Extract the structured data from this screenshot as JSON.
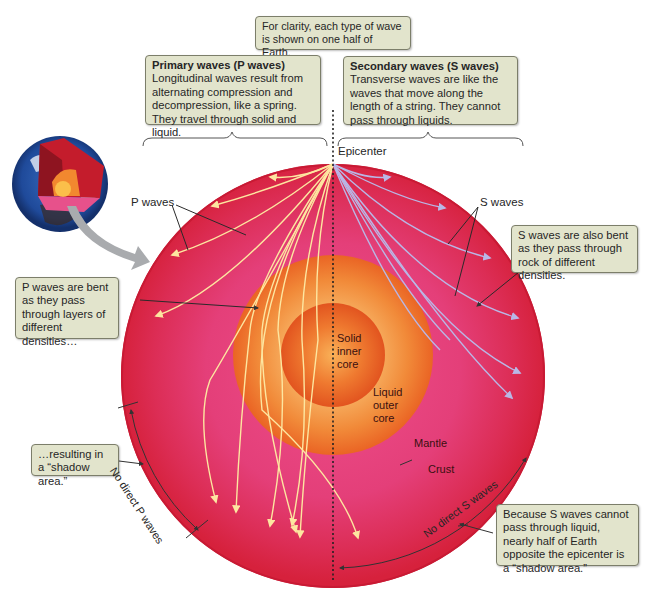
{
  "figure": {
    "title_note": "For clarity, each type of wave is shown on one half of Earth.",
    "colors": {
      "mantle": "#e0356a",
      "crust_edge": "#d9213f",
      "outer_core": "#f27a2a",
      "inner_core": "#e8521d",
      "p_wave": "#fde6a0",
      "s_wave": "#b9b7e6",
      "callout_bg": "#e2e4cc",
      "callout_border": "#7c7e6a"
    }
  },
  "callouts": {
    "primary": {
      "title": "Primary waves (P waves)",
      "body": "Longitudinal waves result from alternating compression and decompression, like a spring. They travel through solid and liquid."
    },
    "secondary": {
      "title": "Secondary waves (S waves)",
      "body": "Transverse waves are like the waves that move along the length of a string. They cannot pass through liquids."
    },
    "p_bent": "P waves are bent as they pass through layers of different densities…",
    "shadow_p": "…resulting in a “shadow area.”",
    "s_bent": "S waves are also bent as they pass through rock of different densities.",
    "shadow_s": "Because S waves cannot pass through liquid, nearly half of Earth opposite the epicenter is a “shadow area.”"
  },
  "labels": {
    "epicenter": "Epicenter",
    "p_waves": "P waves",
    "s_waves": "S waves",
    "solid_inner_core": [
      "Solid",
      "inner",
      "core"
    ],
    "liquid_outer_core": [
      "Liquid",
      "outer",
      "core"
    ],
    "mantle": "Mantle",
    "crust": "Crust",
    "no_direct_p": "No direct P waves",
    "no_direct_s": "No direct S waves"
  },
  "icons": {
    "globe_cutaway": "earth-cutaway-icon",
    "zoom_arrow": "curved-arrow-icon"
  }
}
